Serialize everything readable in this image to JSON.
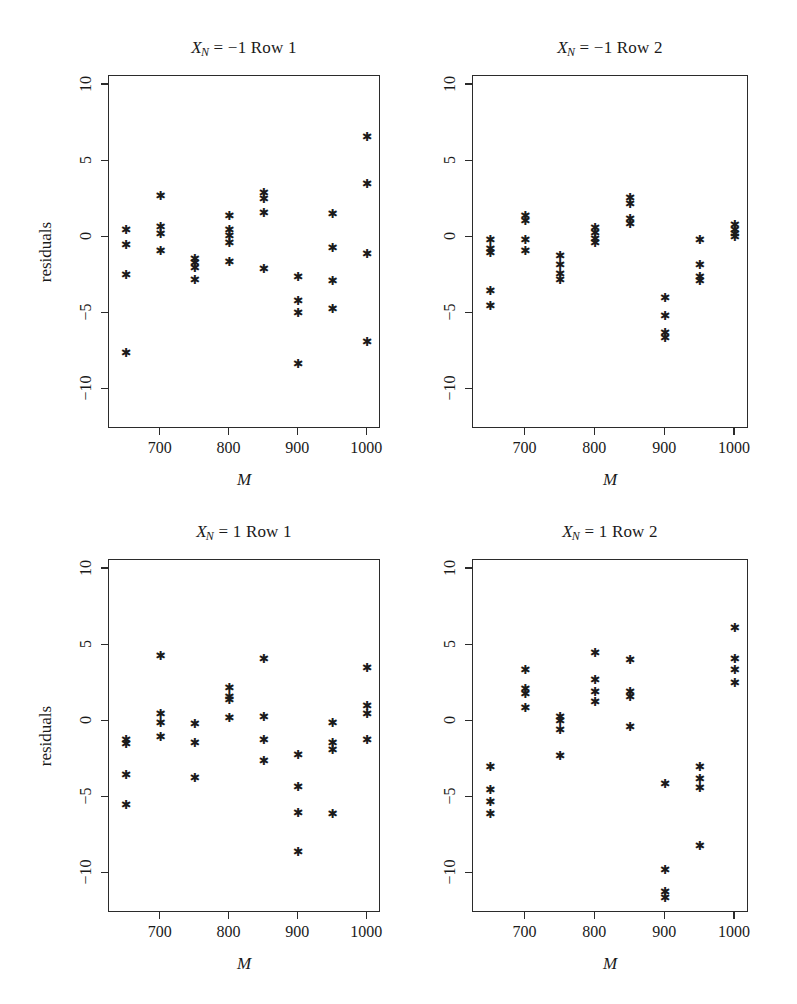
{
  "figure": {
    "background": "#ffffff",
    "point_color": "#1b1b1b",
    "axis_color": "#2b2b2b",
    "point_glyph": "asterisk",
    "axis_titles": {
      "x": "M",
      "y": "residuals"
    }
  },
  "axes": {
    "x": {
      "min": 625,
      "max": 1020,
      "ticks": [
        700,
        800,
        900,
        1000
      ],
      "tick_labels": [
        "700",
        "800",
        "900",
        "1000"
      ]
    },
    "y": {
      "min": -12.6,
      "max": 10.6,
      "ticks": [
        10,
        5,
        0,
        -5,
        -10
      ],
      "tick_labels": [
        "10",
        "5",
        "0",
        "−5",
        "−10"
      ]
    }
  },
  "chart_data": [
    {
      "type": "scatter",
      "panel": 1,
      "title": "X_N = -1 Row 1",
      "title_parts": {
        "var": "X",
        "sub": "N",
        "rest": " = −1 Row 1"
      },
      "xlabel": "M",
      "ylabel": "residuals",
      "xlim": [
        625,
        1020
      ],
      "ylim": [
        -12.6,
        10.6
      ],
      "grid": false,
      "points": [
        [
          650,
          0.5
        ],
        [
          650,
          -0.5
        ],
        [
          650,
          -2.5
        ],
        [
          650,
          -7.6
        ],
        [
          700,
          2.7
        ],
        [
          700,
          0.7
        ],
        [
          700,
          0.2
        ],
        [
          700,
          -0.9
        ],
        [
          750,
          -1.4
        ],
        [
          750,
          -1.7
        ],
        [
          750,
          -2.0
        ],
        [
          750,
          -2.8
        ],
        [
          800,
          1.4
        ],
        [
          800,
          0.5
        ],
        [
          800,
          0.1
        ],
        [
          800,
          -0.4
        ],
        [
          800,
          -1.6
        ],
        [
          850,
          2.9
        ],
        [
          850,
          2.5
        ],
        [
          850,
          1.6
        ],
        [
          850,
          -2.1
        ],
        [
          900,
          -2.6
        ],
        [
          900,
          -4.2
        ],
        [
          900,
          -5.0
        ],
        [
          900,
          -8.3
        ],
        [
          950,
          1.5
        ],
        [
          950,
          -0.7
        ],
        [
          950,
          -2.9
        ],
        [
          950,
          -4.7
        ],
        [
          1000,
          6.6
        ],
        [
          1000,
          3.5
        ],
        [
          1000,
          -1.1
        ],
        [
          1000,
          -6.9
        ]
      ]
    },
    {
      "type": "scatter",
      "panel": 2,
      "title": "X_N = -1 Row 2",
      "title_parts": {
        "var": "X",
        "sub": "N",
        "rest": " = −1 Row 2"
      },
      "xlabel": "M",
      "ylabel": "residuals",
      "xlim": [
        625,
        1020
      ],
      "ylim": [
        -12.6,
        10.6
      ],
      "grid": false,
      "points": [
        [
          650,
          -0.2
        ],
        [
          650,
          -0.8
        ],
        [
          650,
          -1.0
        ],
        [
          650,
          -3.5
        ],
        [
          650,
          -4.5
        ],
        [
          700,
          1.4
        ],
        [
          700,
          1.1
        ],
        [
          700,
          -0.2
        ],
        [
          700,
          -0.9
        ],
        [
          750,
          -1.2
        ],
        [
          750,
          -1.8
        ],
        [
          750,
          -2.4
        ],
        [
          750,
          -2.8
        ],
        [
          800,
          0.6
        ],
        [
          800,
          0.3
        ],
        [
          800,
          -0.1
        ],
        [
          800,
          -0.4
        ],
        [
          850,
          2.6
        ],
        [
          850,
          2.2
        ],
        [
          850,
          1.2
        ],
        [
          850,
          0.9
        ],
        [
          900,
          -4.0
        ],
        [
          900,
          -5.2
        ],
        [
          900,
          -6.3
        ],
        [
          900,
          -6.6
        ],
        [
          950,
          -0.2
        ],
        [
          950,
          -1.8
        ],
        [
          950,
          -2.6
        ],
        [
          950,
          -2.9
        ],
        [
          1000,
          0.8
        ],
        [
          1000,
          0.5
        ],
        [
          1000,
          0.2
        ],
        [
          1000,
          0.0
        ]
      ]
    },
    {
      "type": "scatter",
      "panel": 3,
      "title": "X_N = 1 Row 1",
      "title_parts": {
        "var": "X",
        "sub": "N",
        "rest": " = 1 Row 1"
      },
      "xlabel": "M",
      "ylabel": "residuals",
      "xlim": [
        625,
        1020
      ],
      "ylim": [
        -12.6,
        10.6
      ],
      "grid": false,
      "points": [
        [
          650,
          -1.2
        ],
        [
          650,
          -1.5
        ],
        [
          650,
          -3.5
        ],
        [
          650,
          -5.5
        ],
        [
          700,
          4.3
        ],
        [
          700,
          0.5
        ],
        [
          700,
          -0.1
        ],
        [
          700,
          -1.0
        ],
        [
          750,
          -0.2
        ],
        [
          750,
          -1.4
        ],
        [
          750,
          -3.7
        ],
        [
          800,
          2.2
        ],
        [
          800,
          1.6
        ],
        [
          800,
          1.4
        ],
        [
          800,
          0.2
        ],
        [
          850,
          4.1
        ],
        [
          850,
          0.3
        ],
        [
          850,
          -1.2
        ],
        [
          850,
          -2.6
        ],
        [
          900,
          -2.2
        ],
        [
          900,
          -4.3
        ],
        [
          900,
          -6.0
        ],
        [
          900,
          -8.6
        ],
        [
          950,
          -0.1
        ],
        [
          950,
          -1.4
        ],
        [
          950,
          -1.9
        ],
        [
          950,
          -6.1
        ],
        [
          1000,
          3.5
        ],
        [
          1000,
          1.0
        ],
        [
          1000,
          0.5
        ],
        [
          1000,
          -1.2
        ]
      ]
    },
    {
      "type": "scatter",
      "panel": 4,
      "title": "X_N = 1 Row 2",
      "title_parts": {
        "var": "X",
        "sub": "N",
        "rest": " = 1 Row 2"
      },
      "xlabel": "M",
      "ylabel": "residuals",
      "xlim": [
        625,
        1020
      ],
      "ylim": [
        -12.6,
        10.6
      ],
      "grid": false,
      "points": [
        [
          650,
          -3.0
        ],
        [
          650,
          -4.5
        ],
        [
          650,
          -5.3
        ],
        [
          650,
          -6.1
        ],
        [
          700,
          3.4
        ],
        [
          700,
          2.1
        ],
        [
          700,
          1.8
        ],
        [
          700,
          0.9
        ],
        [
          750,
          0.3
        ],
        [
          750,
          0.0
        ],
        [
          750,
          -0.6
        ],
        [
          750,
          -2.3
        ],
        [
          800,
          4.5
        ],
        [
          800,
          2.7
        ],
        [
          800,
          1.9
        ],
        [
          800,
          1.3
        ],
        [
          850,
          4.0
        ],
        [
          850,
          1.9
        ],
        [
          850,
          1.6
        ],
        [
          850,
          -0.4
        ],
        [
          900,
          -4.1
        ],
        [
          900,
          -9.8
        ],
        [
          900,
          -11.2
        ],
        [
          900,
          -11.6
        ],
        [
          950,
          -3.0
        ],
        [
          950,
          -3.8
        ],
        [
          950,
          -4.4
        ],
        [
          950,
          -8.2
        ],
        [
          1000,
          6.1
        ],
        [
          1000,
          4.1
        ],
        [
          1000,
          3.4
        ],
        [
          1000,
          2.5
        ]
      ]
    }
  ]
}
